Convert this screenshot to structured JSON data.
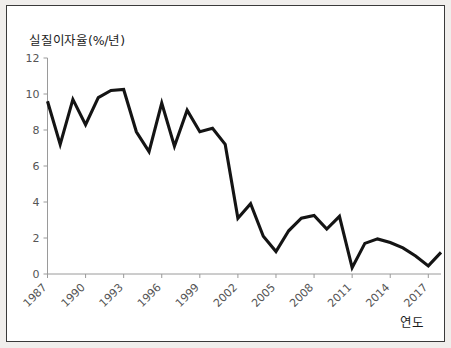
{
  "figure": {
    "background": "#f0eeec",
    "panel_background": "#ffffff",
    "border_color": "#3a3a3a",
    "line_color": "#141414",
    "axis_color": "#9a9a9a"
  },
  "labels": {
    "y_axis_title": "실질이자율(%/년)",
    "x_axis_title": "연도"
  },
  "chart_data": {
    "type": "line",
    "title": "",
    "subtitle": "",
    "xlabel": "연도",
    "ylabel": "실질이자율(%/년)",
    "xlim": [
      1987,
      2018
    ],
    "ylim": [
      0,
      12
    ],
    "ytick_values": [
      0,
      2,
      4,
      6,
      8,
      10,
      12
    ],
    "ytick_labels": [
      "0",
      "2",
      "4",
      "6",
      "8",
      "10",
      "12"
    ],
    "xtick_values": [
      1987,
      1990,
      1993,
      1996,
      1999,
      2002,
      2005,
      2008,
      2011,
      2014,
      2017
    ],
    "xtick_labels": [
      "1987",
      "1990",
      "1993",
      "1996",
      "1999",
      "2002",
      "2005",
      "2008",
      "2011",
      "2014",
      "2017"
    ],
    "xtick_rotation_deg": -45,
    "grid": false,
    "legend": false,
    "legend_position": "none",
    "annotations": [],
    "series": [
      {
        "name": "실질이자율",
        "color": "#141414",
        "x": [
          1987,
          1988,
          1989,
          1990,
          1991,
          1992,
          1993,
          1994,
          1995,
          1996,
          1997,
          1998,
          1999,
          2000,
          2001,
          2002,
          2003,
          2004,
          2005,
          2006,
          2007,
          2008,
          2009,
          2010,
          2011,
          2012,
          2013,
          2014,
          2015,
          2016,
          2017,
          2018
        ],
        "values": [
          9.6,
          7.2,
          9.7,
          8.3,
          9.8,
          10.2,
          10.25,
          7.9,
          6.8,
          9.5,
          7.1,
          9.1,
          7.9,
          8.1,
          7.2,
          3.1,
          3.9,
          2.1,
          1.25,
          2.4,
          3.1,
          3.25,
          2.5,
          3.2,
          0.35,
          1.7,
          1.95,
          1.75,
          1.45,
          1.0,
          0.45,
          1.2
        ]
      }
    ]
  }
}
